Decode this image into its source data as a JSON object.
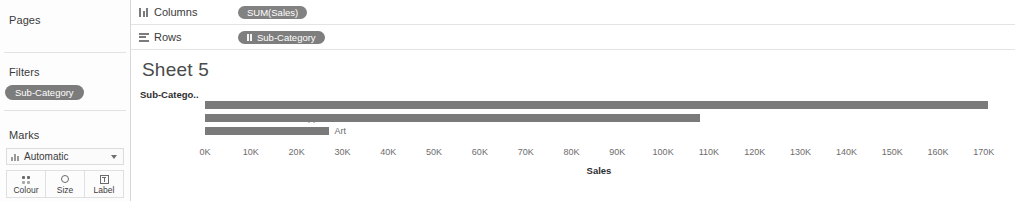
{
  "sidebar": {
    "pages": {
      "label": "Pages"
    },
    "filters": {
      "label": "Filters",
      "pills": [
        {
          "label": "Sub-Category",
          "icon": "dimension-icon"
        }
      ]
    },
    "marks": {
      "label": "Marks",
      "mark_type": "Automatic",
      "mark_type_icon": "bar-mark-icon",
      "caret_icon": "chevron-down-icon",
      "buttons": [
        {
          "label": "Colour",
          "icon": "colour-icon"
        },
        {
          "label": "Size",
          "icon": "size-icon"
        },
        {
          "label": "Label",
          "icon": "label-icon"
        }
      ]
    }
  },
  "shelves": {
    "columns": {
      "label": "Columns",
      "icon": "columns-icon",
      "pills": [
        {
          "label": "SUM(Sales)",
          "type": "measure"
        }
      ]
    },
    "rows": {
      "label": "Rows",
      "icon": "rows-icon",
      "pills": [
        {
          "label": "Sub-Category",
          "type": "dimension",
          "icon": "dimension-icon"
        }
      ]
    }
  },
  "worksheet": {
    "title": "Sheet 5",
    "row_header_title": "Sub-Catego.."
  },
  "chart_data": {
    "type": "bar",
    "orientation": "horizontal",
    "title": "Sheet 5",
    "xlabel": "Sales",
    "ylabel": "Sub-Catego..",
    "categories": [
      "Accessories",
      "Appliances",
      "Art"
    ],
    "values": [
      171000,
      108000,
      27000
    ],
    "xlim": [
      0,
      172000
    ],
    "xticks": [
      0,
      10000,
      20000,
      30000,
      40000,
      50000,
      60000,
      70000,
      80000,
      90000,
      100000,
      110000,
      120000,
      130000,
      140000,
      150000,
      160000,
      170000
    ],
    "xticklabels": [
      "0K",
      "10K",
      "20K",
      "30K",
      "40K",
      "50K",
      "60K",
      "70K",
      "80K",
      "90K",
      "100K",
      "110K",
      "120K",
      "130K",
      "140K",
      "150K",
      "160K",
      "170K"
    ],
    "grid": false,
    "legend": false,
    "bar_color": "#7a7a7a"
  }
}
